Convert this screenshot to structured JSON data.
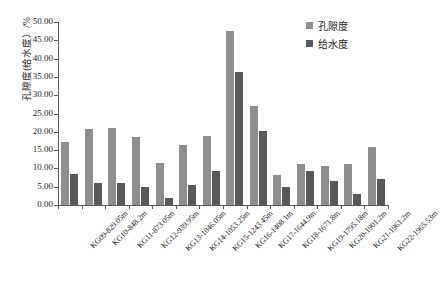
{
  "chart_data": {
    "type": "bar",
    "title": "",
    "xlabel": "",
    "ylabel": "孔隙度(给水度）/%",
    "ylim": [
      0,
      50
    ],
    "ytick_labels": [
      "0.00",
      "5.00",
      "10.00",
      "15.00",
      "20.00",
      "25.00",
      "30.00",
      "35.00",
      "40.00",
      "45.00",
      "50.00"
    ],
    "ytick_values": [
      0,
      5,
      10,
      15,
      20,
      25,
      30,
      35,
      40,
      45,
      50
    ],
    "grid": false,
    "legend_position": "top-right",
    "categories": [
      "KG09-829.05m",
      "KG10-848.2m",
      "KG11-873.05m",
      "KG12-939.95m",
      "KG13-1046.05m",
      "KG14-1053.25m",
      "KG15-1243.45m",
      "KG16-1408.1m",
      "KG17-1644.9m",
      "KG18-1671.8m",
      "KG19-1795.18m",
      "KG20-1901.2m",
      "KG21-1961.2m",
      "KG22-1965.53m"
    ],
    "series": [
      {
        "name": "孔隙度",
        "color": "#8e8e8e",
        "values": [
          17.3,
          20.8,
          21.0,
          18.7,
          11.5,
          16.5,
          18.8,
          47.6,
          27.1,
          8.1,
          11.2,
          10.7,
          11.1,
          15.8
        ]
      },
      {
        "name": "给水度",
        "color": "#595959",
        "values": [
          8.5,
          6.1,
          5.9,
          5.0,
          1.8,
          5.5,
          9.3,
          36.4,
          20.2,
          4.9,
          9.2,
          6.6,
          3.1,
          7.1
        ]
      }
    ]
  }
}
